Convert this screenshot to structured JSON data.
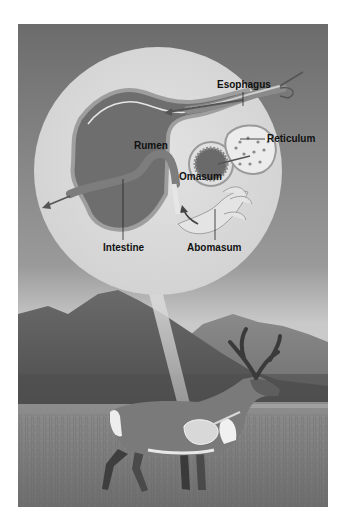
{
  "figure": {
    "color_mode": "grayscale",
    "labels": {
      "esophagus": "Esophagus",
      "reticulum": "Reticulum",
      "rumen": "Rumen",
      "omasum": "Omasum",
      "intestine": "Intestine",
      "abomasum": "Abomasum"
    },
    "colors": {
      "sky_top": "#6e6e6e",
      "sky_bottom": "#cfcfcf",
      "circle_fill": "#d9d9d9",
      "mountain_dark": "#5a5a5a",
      "mountain_far": "#8a8a8a",
      "grass": "#7a7a7a",
      "organ_wall": "#9a9a9a",
      "organ_inner": "#6a6a6a",
      "label_text": "#111111"
    }
  }
}
